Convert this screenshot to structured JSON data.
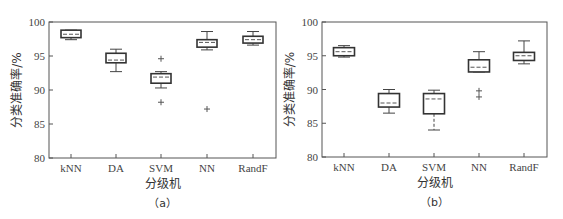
{
  "chart_data": [
    {
      "type": "box",
      "panel": "a",
      "caption": "（a）",
      "title": "",
      "xlabel": "分级机",
      "ylabel": "分类准确率/%",
      "ylim": [
        80,
        100
      ],
      "yticks": [
        80,
        85,
        90,
        95,
        100
      ],
      "grid": false,
      "categories": [
        "kNN",
        "DA",
        "SVM",
        "NN",
        "RandF"
      ],
      "boxes": [
        {
          "category": "kNN",
          "whisker_high": 98.8,
          "q3": 98.8,
          "median": 98.2,
          "q1": 97.7,
          "whisker_low": 97.4,
          "outliers": []
        },
        {
          "category": "DA",
          "whisker_high": 96.0,
          "q3": 95.4,
          "median": 94.4,
          "q1": 94.0,
          "whisker_low": 92.7,
          "outliers": []
        },
        {
          "category": "SVM",
          "whisker_high": 92.7,
          "q3": 92.4,
          "median": 91.9,
          "q1": 91.0,
          "whisker_low": 90.3,
          "outliers": [
            94.6,
            88.2
          ]
        },
        {
          "category": "NN",
          "whisker_high": 98.6,
          "q3": 97.4,
          "median": 97.0,
          "q1": 96.3,
          "whisker_low": 95.9,
          "outliers": [
            87.2
          ]
        },
        {
          "category": "RandF",
          "whisker_high": 98.6,
          "q3": 97.9,
          "median": 97.4,
          "q1": 96.9,
          "whisker_low": 96.6,
          "outliers": []
        }
      ],
      "layout": {
        "x0": 49,
        "x1": 276,
        "y_top": 22,
        "y_bottom": 158,
        "cat_x": [
          71,
          116,
          161,
          207,
          253
        ],
        "box_w": 20
      }
    },
    {
      "type": "box",
      "panel": "b",
      "caption": "（b）",
      "title": "",
      "xlabel": "分级机",
      "ylabel": "分类准确率/%",
      "ylim": [
        80,
        100
      ],
      "yticks": [
        80,
        85,
        90,
        95,
        100
      ],
      "grid": false,
      "categories": [
        "kNN",
        "DA",
        "SVM",
        "NN",
        "RandF"
      ],
      "boxes": [
        {
          "category": "kNN",
          "whisker_high": 96.5,
          "q3": 96.2,
          "median": 95.6,
          "q1": 95.0,
          "whisker_low": 94.8,
          "outliers": []
        },
        {
          "category": "DA",
          "whisker_high": 90.0,
          "q3": 89.4,
          "median": 88.0,
          "q1": 87.4,
          "whisker_low": 86.5,
          "outliers": []
        },
        {
          "category": "SVM",
          "whisker_high": 89.9,
          "q3": 89.4,
          "median": 88.6,
          "q1": 86.4,
          "whisker_low": 84.0,
          "outliers": []
        },
        {
          "category": "NN",
          "whisker_high": 95.6,
          "q3": 94.4,
          "median": 93.3,
          "q1": 92.6,
          "whisker_low": 92.6,
          "outliers": [
            89.8,
            88.9
          ]
        },
        {
          "category": "RandF",
          "whisker_high": 97.2,
          "q3": 95.5,
          "median": 95.0,
          "q1": 94.3,
          "whisker_low": 93.8,
          "outliers": []
        }
      ],
      "layout": {
        "x0": 322,
        "x1": 547,
        "y_top": 22,
        "y_bottom": 157,
        "cat_x": [
          344,
          389,
          434,
          479,
          524
        ],
        "box_w": 21
      }
    }
  ]
}
